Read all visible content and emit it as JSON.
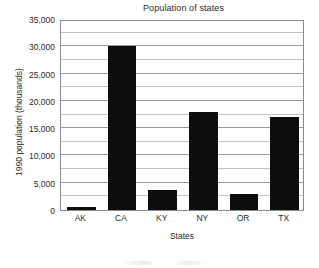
{
  "chart_data": {
    "type": "bar",
    "title": "Population of states",
    "xlabel": "States",
    "ylabel": "1990 population (thousands)",
    "categories": [
      "AK",
      "CA",
      "KY",
      "NY",
      "OR",
      "TX"
    ],
    "values": [
      550,
      30000,
      3700,
      17950,
      2850,
      16990
    ],
    "ylim": [
      0,
      35000
    ],
    "ytick_labels": [
      "0",
      "5,000",
      "10,000",
      "15,000",
      "20,000",
      "25,000",
      "30,000",
      "35,000"
    ],
    "ytick_values": [
      0,
      5000,
      10000,
      15000,
      20000,
      25000,
      30000,
      35000
    ],
    "minor_tick_step": 2500,
    "grid": true,
    "grid_axis": "y",
    "legend": null,
    "bar_color": "#0d0d0d",
    "grid_color": "#9a9a9a",
    "minor_grid_color": "#c2c2c2",
    "axis_color": "#8a8a8a",
    "background": "#ffffff"
  }
}
